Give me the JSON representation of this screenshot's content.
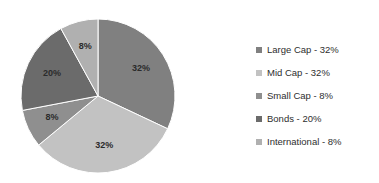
{
  "chart_data": {
    "type": "pie",
    "title": "",
    "categories": [
      "Large Cap",
      "Mid Cap",
      "Small Cap",
      "Bonds",
      "International"
    ],
    "values": [
      32,
      32,
      8,
      20,
      8
    ],
    "value_unit": "%",
    "data_labels": [
      "32%",
      "32%",
      "8%",
      "20%",
      "8%"
    ],
    "colors": [
      "#808080",
      "#c2c2c2",
      "#8f8f8f",
      "#6b6b6b",
      "#b0b0b0"
    ],
    "legend_position": "right",
    "grid": false,
    "start_angle_deg": 0,
    "direction": "clockwise",
    "slices": [
      {
        "label": "Large Cap",
        "value": 32,
        "data_label": "32%",
        "color": "#808080",
        "legend_label": "Large Cap - 32%"
      },
      {
        "label": "Mid Cap",
        "value": 32,
        "data_label": "32%",
        "color": "#c2c2c2",
        "legend_label": "Mid Cap - 32%"
      },
      {
        "label": "Small Cap",
        "value": 8,
        "data_label": "8%",
        "color": "#8f8f8f",
        "legend_label": "Small Cap - 8%"
      },
      {
        "label": "Bonds",
        "value": 20,
        "data_label": "20%",
        "color": "#6b6b6b",
        "legend_label": "Bonds - 20%"
      },
      {
        "label": "International",
        "value": 8,
        "data_label": "8%",
        "color": "#b0b0b0",
        "legend_label": "International - 8%"
      }
    ]
  },
  "legend": {
    "items": [
      {
        "label": "Large Cap - 32%"
      },
      {
        "label": "Mid Cap - 32%"
      },
      {
        "label": "Small Cap - 8%"
      },
      {
        "label": "Bonds - 20%"
      },
      {
        "label": "International - 8%"
      }
    ]
  }
}
